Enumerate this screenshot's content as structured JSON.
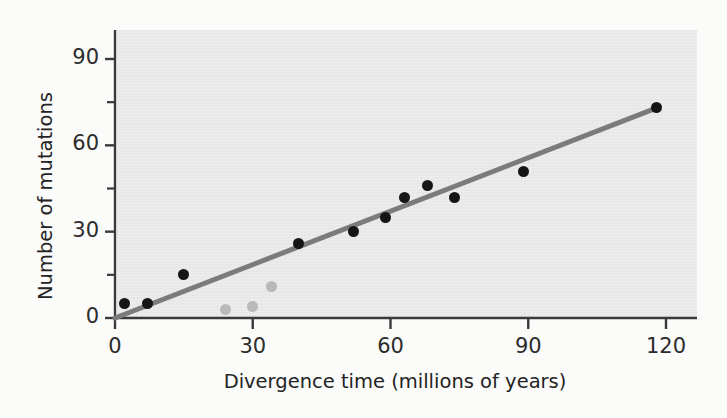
{
  "figure": {
    "background_color": "#fbfbfa",
    "plot_background_color": "#e9e9e9"
  },
  "chart_data": {
    "type": "scatter",
    "title": "",
    "xlabel": "Divergence time (millions of years)",
    "ylabel": "Number of mutations",
    "xlim": [
      0,
      124
    ],
    "ylim": [
      0,
      102
    ],
    "xticks": [
      0,
      30,
      60,
      90,
      120
    ],
    "xtick_labels": [
      "0",
      "30",
      "60",
      "90",
      "120"
    ],
    "yticks": [
      0,
      30,
      60,
      90
    ],
    "ytick_labels": [
      "0",
      "30",
      "60",
      "90"
    ],
    "yticks_minor": [
      15,
      45,
      75,
      105
    ],
    "grid": false,
    "legend": null,
    "series": [
      {
        "name": "primary-data",
        "marker": "filled-circle",
        "color": "#151515",
        "marker_size": 11,
        "points": [
          {
            "x": 2,
            "y": 5
          },
          {
            "x": 7,
            "y": 5
          },
          {
            "x": 15,
            "y": 15
          },
          {
            "x": 40,
            "y": 26
          },
          {
            "x": 52,
            "y": 30
          },
          {
            "x": 59,
            "y": 35
          },
          {
            "x": 63,
            "y": 42
          },
          {
            "x": 68,
            "y": 46
          },
          {
            "x": 74,
            "y": 42
          },
          {
            "x": 89,
            "y": 51
          },
          {
            "x": 118,
            "y": 73
          }
        ]
      },
      {
        "name": "outlier-data",
        "marker": "filled-circle",
        "color": "#b9b9b9",
        "marker_size": 11,
        "points": [
          {
            "x": 24,
            "y": 3
          },
          {
            "x": 30,
            "y": 4
          },
          {
            "x": 34,
            "y": 11
          }
        ]
      }
    ],
    "trendline": {
      "name": "regression-line",
      "color": "#7b7b7b",
      "width": 5,
      "x_start": 0,
      "y_start": 0,
      "x_end": 118,
      "y_end": 73
    }
  },
  "axis": {
    "line_color": "#3a3a3a",
    "tick_color": "#3a3a3a"
  }
}
